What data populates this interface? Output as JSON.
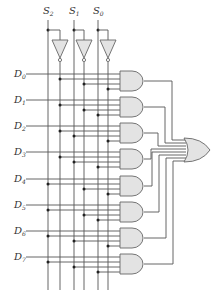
{
  "diagram": {
    "type": "8-to-1 multiplexer logic circuit",
    "select_inputs": [
      {
        "label": "S",
        "sub": "2",
        "x": 48,
        "inv_x": 60
      },
      {
        "label": "S",
        "sub": "1",
        "x": 74,
        "inv_x": 84
      },
      {
        "label": "S",
        "sub": "0",
        "x": 98,
        "inv_x": 108
      }
    ],
    "data_inputs": [
      {
        "label": "D",
        "sub": "0",
        "y": 74
      },
      {
        "label": "D",
        "sub": "1",
        "y": 100
      },
      {
        "label": "D",
        "sub": "2",
        "y": 126
      },
      {
        "label": "D",
        "sub": "3",
        "y": 152
      },
      {
        "label": "D",
        "sub": "4",
        "y": 179
      },
      {
        "label": "D",
        "sub": "5",
        "y": 205
      },
      {
        "label": "D",
        "sub": "6",
        "y": 231
      },
      {
        "label": "D",
        "sub": "7",
        "y": 257
      }
    ],
    "and_gates": 8,
    "or_gates": 1,
    "inverters": 3,
    "colors": {
      "gate_fill": "#e3e3e3",
      "wire": "#555555"
    }
  }
}
